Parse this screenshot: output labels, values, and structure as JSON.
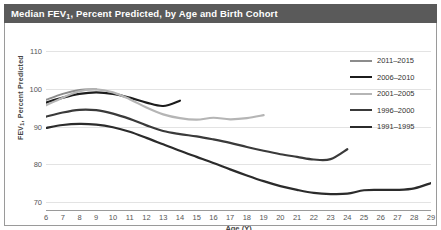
{
  "title_main": "Median FEV",
  "title_sub": "1",
  "title_rest": ", Percent Predicted, by Age and Birth Cohort",
  "colors": {
    "title_bar": "#5a5a5a",
    "frame": "#9a9a9a",
    "grid": "#e3e3e3",
    "background": "#ffffff"
  },
  "chart_data": {
    "type": "line",
    "xlabel": "Age (Y)",
    "ylabel": "FEV₁, Percent Predicted",
    "xlim": [
      6,
      29
    ],
    "ylim": [
      68,
      112
    ],
    "grid": true,
    "legend_position": "upper-right",
    "xticks": [
      6,
      7,
      8,
      9,
      10,
      11,
      12,
      13,
      14,
      15,
      16,
      17,
      18,
      19,
      20,
      21,
      22,
      23,
      24,
      25,
      26,
      27,
      28,
      29
    ],
    "yticks": [
      70,
      80,
      90,
      100,
      110
    ],
    "series": [
      {
        "name": "2011–2015",
        "color": "#8c8c8c",
        "width": 2.0,
        "x": [
          6,
          7,
          8,
          9
        ],
        "values": [
          97.0,
          98.6,
          99.6,
          99.8
        ]
      },
      {
        "name": "2006–2010",
        "color": "#1c1c1c",
        "width": 2.2,
        "x": [
          6,
          7,
          8,
          9,
          10,
          11,
          12,
          13,
          14
        ],
        "values": [
          96.3,
          97.6,
          98.6,
          99.0,
          98.6,
          97.6,
          96.3,
          95.4,
          96.8
        ]
      },
      {
        "name": "2001–2005",
        "color": "#b5b5b5",
        "width": 2.2,
        "x": [
          6,
          7,
          8,
          9,
          10,
          11,
          12,
          13,
          14,
          15,
          16,
          17,
          18,
          19
        ],
        "values": [
          95.6,
          97.6,
          99.3,
          99.8,
          99.0,
          97.2,
          95.0,
          93.2,
          92.2,
          91.8,
          92.3,
          91.9,
          92.2,
          93.0
        ]
      },
      {
        "name": "1996–2000",
        "color": "#3a3a3a",
        "width": 2.2,
        "x": [
          6,
          7,
          8,
          9,
          10,
          11,
          12,
          13,
          14,
          15,
          16,
          17,
          18,
          19,
          20,
          21,
          22,
          23,
          24
        ],
        "values": [
          92.6,
          93.7,
          94.4,
          94.3,
          93.4,
          92.0,
          90.3,
          88.8,
          88.0,
          87.4,
          86.6,
          85.7,
          84.6,
          83.6,
          82.7,
          82.0,
          81.3,
          81.4,
          84.0
        ]
      },
      {
        "name": "1991–1995",
        "color": "#2b2b2b",
        "width": 2.2,
        "x": [
          6,
          7,
          8,
          9,
          10,
          11,
          12,
          13,
          14,
          15,
          16,
          17,
          18,
          19,
          20,
          21,
          22,
          23,
          24,
          25,
          26,
          27,
          28,
          29
        ],
        "values": [
          89.6,
          90.4,
          90.7,
          90.5,
          89.8,
          88.6,
          87.0,
          85.3,
          83.6,
          82.0,
          80.4,
          78.7,
          77.1,
          75.6,
          74.3,
          73.3,
          72.5,
          72.2,
          72.3,
          73.2,
          73.3,
          73.3,
          73.7,
          75.1
        ]
      }
    ]
  }
}
